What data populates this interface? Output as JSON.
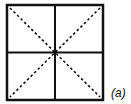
{
  "figure": {
    "label": "(a)",
    "colors": {
      "stroke": "#111111",
      "background": "#ffffff"
    },
    "square": {
      "x": 6,
      "y": 4,
      "size": 97
    },
    "lines": {
      "solid": [
        "outer-border",
        "vertical-midline",
        "horizontal-midline"
      ],
      "dashed": [
        "diagonal-top-left-to-bottom-right",
        "diagonal-top-right-to-bottom-left"
      ]
    }
  }
}
